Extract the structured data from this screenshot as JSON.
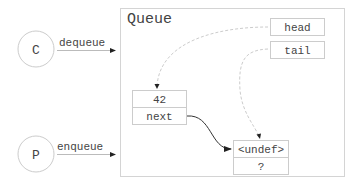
{
  "diagram": {
    "container": {
      "title": "Queue"
    },
    "actors": [
      {
        "id": "consumer",
        "label": "C",
        "operation": "dequeue"
      },
      {
        "id": "producer",
        "label": "P",
        "operation": "enqueue"
      }
    ],
    "pointers": [
      {
        "id": "head",
        "label": "head"
      },
      {
        "id": "tail",
        "label": "tail"
      }
    ],
    "nodes": [
      {
        "id": "node1",
        "value": "42",
        "next": "next"
      },
      {
        "id": "node2",
        "value": "<undef>",
        "next": "?"
      }
    ],
    "edges": [
      {
        "from": "consumer",
        "to": "queue",
        "label": "dequeue",
        "style": "solid-light"
      },
      {
        "from": "producer",
        "to": "queue",
        "label": "enqueue",
        "style": "solid-light"
      },
      {
        "from": "head",
        "to": "node1",
        "style": "dashed"
      },
      {
        "from": "tail",
        "to": "node2",
        "style": "dashed"
      },
      {
        "from": "node1.next",
        "to": "node2",
        "style": "solid"
      }
    ],
    "colors": {
      "border": "#cccccc",
      "text": "#444444",
      "dashed_edge": "#cccccc",
      "solid_edge": "#333333",
      "light_edge": "#bbbbbb"
    }
  }
}
